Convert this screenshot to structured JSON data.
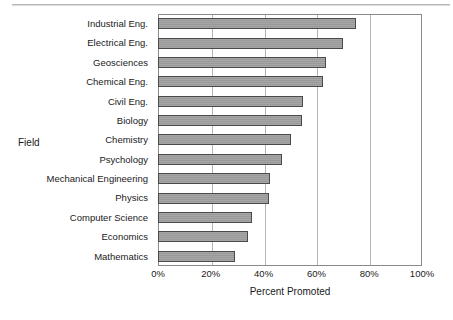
{
  "chart_data": {
    "type": "bar",
    "orientation": "horizontal",
    "title": "",
    "xlabel": "Percent Promoted",
    "ylabel": "Field",
    "xlim": [
      0,
      100
    ],
    "xticks": [
      "0%",
      "20%",
      "40%",
      "60%",
      "80%",
      "100%"
    ],
    "xtick_values": [
      0,
      20,
      40,
      60,
      80,
      100
    ],
    "grid": true,
    "legend": null,
    "categories": [
      "Industrial Eng.",
      "Electrical Eng.",
      "Geosciences",
      "Chemical Eng.",
      "Civil Eng.",
      "Biology",
      "Chemistry",
      "Psychology",
      "Mechanical Engineering",
      "Physics",
      "Computer Science",
      "Economics",
      "Mathematics"
    ],
    "values": [
      75,
      70,
      63.5,
      62.5,
      55,
      54.5,
      50.5,
      47,
      42.5,
      42,
      35.5,
      34,
      29
    ],
    "bar_color": "#a0a0a0",
    "bar_border_color": "#4a4a4a",
    "plot_border_color": "#8a8a8a",
    "gridline_color": "#b5b5b5"
  }
}
